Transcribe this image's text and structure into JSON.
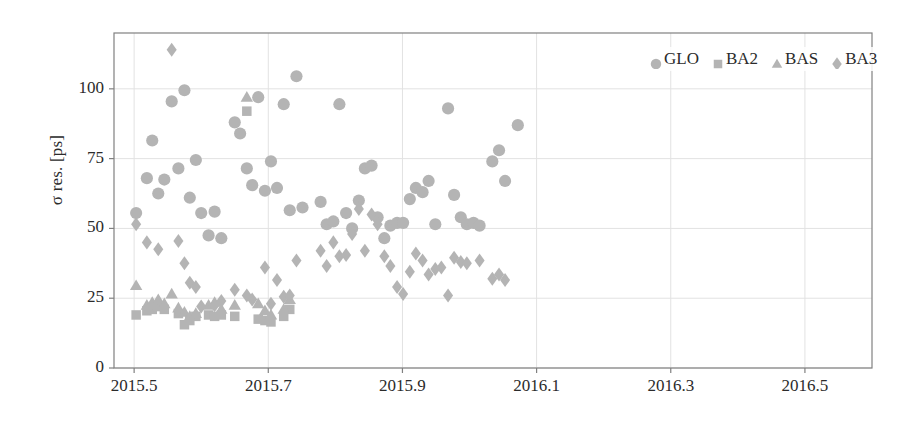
{
  "chart_data": {
    "type": "scatter",
    "title": "",
    "xlabel": "",
    "ylabel": "σ res. [ps]",
    "xlim": [
      2015.47,
      2016.6
    ],
    "ylim": [
      0,
      120
    ],
    "xticks": [
      "2015.5",
      "2015.7",
      "2015.9",
      "2016.1",
      "2016.3",
      "2016.5"
    ],
    "xtick_values": [
      2015.5,
      2015.7,
      2015.9,
      2016.1,
      2016.3,
      2016.5
    ],
    "yticks": [
      "0",
      "25",
      "50",
      "75",
      "100"
    ],
    "ytick_values": [
      0,
      25,
      50,
      75,
      100
    ],
    "grid": true,
    "legend_position": "top-right",
    "marker_color": "#b4b4b4",
    "axis_color": "#808080",
    "grid_color": "#e2e2e2",
    "series": [
      {
        "name": "GLO",
        "marker": "circle",
        "points": [
          [
            2015.503,
            55.5
          ],
          [
            2015.519,
            68.0
          ],
          [
            2015.527,
            81.5
          ],
          [
            2015.536,
            62.5
          ],
          [
            2015.545,
            67.5
          ],
          [
            2015.556,
            95.5
          ],
          [
            2015.566,
            71.5
          ],
          [
            2015.575,
            99.5
          ],
          [
            2015.583,
            61.0
          ],
          [
            2015.592,
            74.5
          ],
          [
            2015.6,
            55.5
          ],
          [
            2015.611,
            47.5
          ],
          [
            2015.62,
            56.0
          ],
          [
            2015.63,
            46.5
          ],
          [
            2015.65,
            88.0
          ],
          [
            2015.658,
            84.0
          ],
          [
            2015.668,
            71.5
          ],
          [
            2015.676,
            65.5
          ],
          [
            2015.685,
            97.0
          ],
          [
            2015.695,
            63.5
          ],
          [
            2015.704,
            74.0
          ],
          [
            2015.713,
            64.5
          ],
          [
            2015.723,
            94.5
          ],
          [
            2015.732,
            56.5
          ],
          [
            2015.742,
            104.5
          ],
          [
            2015.751,
            57.5
          ],
          [
            2015.778,
            59.5
          ],
          [
            2015.787,
            51.5
          ],
          [
            2015.797,
            52.5
          ],
          [
            2015.806,
            94.5
          ],
          [
            2015.816,
            55.5
          ],
          [
            2015.825,
            50.0
          ],
          [
            2015.835,
            60.0
          ],
          [
            2015.844,
            71.5
          ],
          [
            2015.854,
            72.5
          ],
          [
            2015.863,
            54.0
          ],
          [
            2015.873,
            46.5
          ],
          [
            2015.882,
            51.0
          ],
          [
            2015.892,
            52.0
          ],
          [
            2015.901,
            52.0
          ],
          [
            2015.911,
            60.5
          ],
          [
            2015.92,
            64.5
          ],
          [
            2015.93,
            63.0
          ],
          [
            2015.939,
            67.0
          ],
          [
            2015.949,
            51.5
          ],
          [
            2015.968,
            93.0
          ],
          [
            2015.977,
            62.0
          ],
          [
            2015.987,
            54.0
          ],
          [
            2015.996,
            51.5
          ],
          [
            2016.006,
            52.0
          ],
          [
            2016.015,
            51.0
          ],
          [
            2016.034,
            74.0
          ],
          [
            2016.044,
            78.0
          ],
          [
            2016.053,
            67.0
          ],
          [
            2016.072,
            87.0
          ]
        ]
      },
      {
        "name": "BA2",
        "marker": "square",
        "points": [
          [
            2015.503,
            19.0
          ],
          [
            2015.519,
            20.5
          ],
          [
            2015.527,
            21.0
          ],
          [
            2015.536,
            22.0
          ],
          [
            2015.545,
            21.0
          ],
          [
            2015.566,
            19.5
          ],
          [
            2015.575,
            15.5
          ],
          [
            2015.583,
            17.0
          ],
          [
            2015.592,
            18.5
          ],
          [
            2015.611,
            19.0
          ],
          [
            2015.62,
            18.5
          ],
          [
            2015.63,
            19.0
          ],
          [
            2015.65,
            18.5
          ],
          [
            2015.668,
            92.0
          ],
          [
            2015.685,
            17.5
          ],
          [
            2015.695,
            17.0
          ],
          [
            2015.704,
            16.5
          ],
          [
            2015.723,
            18.5
          ],
          [
            2015.732,
            21.0
          ]
        ]
      },
      {
        "name": "BAS",
        "marker": "triangle",
        "points": [
          [
            2015.503,
            29.5
          ],
          [
            2015.519,
            22.5
          ],
          [
            2015.527,
            23.5
          ],
          [
            2015.536,
            24.5
          ],
          [
            2015.545,
            23.0
          ],
          [
            2015.556,
            26.5
          ],
          [
            2015.566,
            21.5
          ],
          [
            2015.575,
            20.0
          ],
          [
            2015.583,
            18.5
          ],
          [
            2015.592,
            19.5
          ],
          [
            2015.611,
            22.5
          ],
          [
            2015.62,
            23.5
          ],
          [
            2015.63,
            21.0
          ],
          [
            2015.65,
            22.5
          ],
          [
            2015.668,
            97.0
          ],
          [
            2015.685,
            23.0
          ],
          [
            2015.695,
            20.5
          ],
          [
            2015.704,
            19.0
          ],
          [
            2015.723,
            21.0
          ],
          [
            2015.732,
            24.5
          ]
        ]
      },
      {
        "name": "BA3",
        "marker": "diamond",
        "points": [
          [
            2015.503,
            51.5
          ],
          [
            2015.519,
            45.0
          ],
          [
            2015.536,
            42.5
          ],
          [
            2015.556,
            114.0
          ],
          [
            2015.566,
            45.5
          ],
          [
            2015.575,
            37.5
          ],
          [
            2015.583,
            30.5
          ],
          [
            2015.592,
            29.0
          ],
          [
            2015.6,
            22.0
          ],
          [
            2015.62,
            22.5
          ],
          [
            2015.63,
            24.0
          ],
          [
            2015.65,
            28.0
          ],
          [
            2015.668,
            26.0
          ],
          [
            2015.676,
            24.5
          ],
          [
            2015.695,
            36.0
          ],
          [
            2015.704,
            23.0
          ],
          [
            2015.713,
            31.5
          ],
          [
            2015.723,
            25.5
          ],
          [
            2015.732,
            26.0
          ],
          [
            2015.742,
            38.5
          ],
          [
            2015.778,
            42.0
          ],
          [
            2015.787,
            36.5
          ],
          [
            2015.797,
            45.0
          ],
          [
            2015.806,
            40.0
          ],
          [
            2015.816,
            40.5
          ],
          [
            2015.825,
            48.0
          ],
          [
            2015.835,
            57.0
          ],
          [
            2015.844,
            42.0
          ],
          [
            2015.854,
            55.0
          ],
          [
            2015.863,
            51.5
          ],
          [
            2015.873,
            40.0
          ],
          [
            2015.882,
            36.5
          ],
          [
            2015.892,
            29.0
          ],
          [
            2015.901,
            26.5
          ],
          [
            2015.911,
            34.5
          ],
          [
            2015.92,
            41.0
          ],
          [
            2015.93,
            38.5
          ],
          [
            2015.939,
            33.5
          ],
          [
            2015.949,
            35.5
          ],
          [
            2015.958,
            36.0
          ],
          [
            2015.968,
            26.0
          ],
          [
            2015.977,
            39.5
          ],
          [
            2015.987,
            38.0
          ],
          [
            2015.996,
            37.5
          ],
          [
            2016.015,
            38.5
          ],
          [
            2016.034,
            32.0
          ],
          [
            2016.044,
            33.5
          ],
          [
            2016.053,
            31.5
          ]
        ]
      }
    ]
  },
  "legend": {
    "entries": [
      {
        "label": "GLO",
        "marker": "circle"
      },
      {
        "label": "BA2",
        "marker": "square"
      },
      {
        "label": "BAS",
        "marker": "triangle"
      },
      {
        "label": "BA3",
        "marker": "diamond"
      }
    ]
  }
}
